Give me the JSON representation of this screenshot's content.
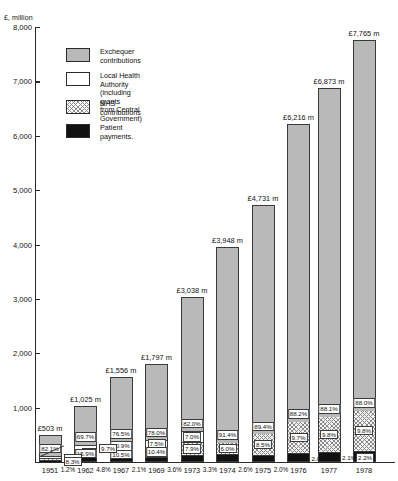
{
  "axis": {
    "unit_label": "£, million",
    "y_ticks": [
      "8,000",
      "7,000",
      "6,000",
      "5,000",
      "4,000",
      "3,000",
      "2,000",
      "1,000"
    ],
    "y_max": 8000,
    "y_min": 0
  },
  "legend": {
    "items": [
      {
        "key": "exchequer",
        "label": "Exchequer contributions",
        "swatch": "solid-grey"
      },
      {
        "key": "lha",
        "label": "Local Health Authority (including grants\nfrom Central Government)",
        "swatch": "white"
      },
      {
        "key": "nhs",
        "label": "NHS contributions",
        "swatch": "hatched"
      },
      {
        "key": "patient",
        "label": "Patient payments.",
        "swatch": "black"
      }
    ]
  },
  "chart_data": {
    "type": "bar",
    "title": "£, million",
    "xlabel": "",
    "ylabel": "£, million",
    "ylim": [
      0,
      8000
    ],
    "grid": false,
    "legend_position": "top-left",
    "stacked": true,
    "categories": [
      "1951",
      "1962",
      "1967",
      "1969",
      "1973",
      "1974",
      "1975",
      "1976",
      "1977",
      "1978"
    ],
    "totals": [
      503,
      1025,
      1556,
      1797,
      3038,
      3948,
      4731,
      6216,
      6873,
      7765
    ],
    "total_labels": [
      "£503 m",
      "£1,025 m",
      "£1,556 m",
      "£1,797 m",
      "£3,038 m",
      "£3,948 m",
      "£4,731 m",
      "£6,216 m",
      "£6,873 m",
      "£7,765 m"
    ],
    "series": [
      {
        "name": "Exchequer contributions",
        "values": [
          82.1,
          69.7,
          76.5,
          78.0,
          82.0,
          91.4,
          89.4,
          88.2,
          88.1,
          88.0
        ],
        "labels": [
          "82.1%",
          "69.7%",
          "76.5%",
          "78.0%",
          "82.0%",
          "91.4%",
          "89.4%",
          "88.2%",
          "88.1%",
          "88.0%"
        ]
      },
      {
        "name": "Local Health Authority (including grants from Central Government)",
        "values": [
          8.3,
          9.7,
          10.9,
          7.5,
          7.0,
          null,
          null,
          null,
          null,
          null
        ],
        "labels": [
          "8.3%",
          "9.7%",
          "10.9%",
          "7.5%",
          "7.0%",
          "",
          "",
          "",
          "",
          ""
        ]
      },
      {
        "name": "NHS contributions",
        "values": [
          8.3,
          15.9,
          10.5,
          10.4,
          7.9,
          6.0,
          8.5,
          9.7,
          9.8,
          9.8
        ],
        "labels": [
          "8.3%",
          "15.9%",
          "10.5%",
          "10.4%",
          "7.9%",
          "6.0%",
          "8.5%",
          "9.7%",
          "9.8%",
          "9.8%"
        ]
      },
      {
        "name": "Patient payments",
        "values": [
          1.2,
          4.8,
          2.1,
          3.6,
          3.3,
          2.6,
          2.0,
          2.0,
          2.1,
          2.2
        ],
        "labels": [
          "1.2%",
          "4.8%",
          "2.1%",
          "3.6%",
          "3.3%",
          "2.6%",
          "2.0%",
          "2.0%",
          "2.1%",
          "2.2%"
        ]
      }
    ],
    "axis_patient_labels": [
      "1.2%",
      "4.8%",
      "2.1%",
      "3.6%",
      "3.3%",
      "2.6%",
      "2.0%"
    ],
    "inline_patient_labels": [
      "2.0%",
      "2.1%",
      "2.2%"
    ]
  }
}
